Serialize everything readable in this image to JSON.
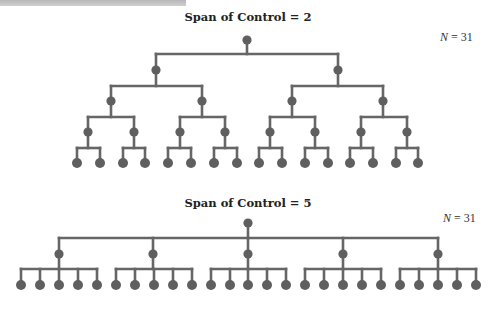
{
  "colors": {
    "line": "#666666",
    "node": "#5f5f5f",
    "text": "#222222",
    "topbar": "#c4c4c4"
  },
  "diagrams": [
    {
      "title": "Span of Control = 2",
      "title_pos": [
        248,
        21
      ],
      "n_label": {
        "var": "N",
        "eq": " = 31",
        "pos": [
          440,
          41
        ]
      },
      "span": 2,
      "total_nodes": 31,
      "levels": [
        {
          "y": 40,
          "bar_y": null,
          "x": [
            247
          ]
        },
        {
          "y": 70,
          "bar_y": 54,
          "x": [
            156,
            338
          ]
        },
        {
          "y": 101,
          "bar_y": 86,
          "x": [
            111,
            202,
            292,
            383
          ]
        },
        {
          "y": 132,
          "bar_y": 117,
          "x": [
            88,
            134,
            180,
            225,
            270,
            315,
            361,
            407
          ]
        },
        {
          "y": 163,
          "bar_y": 148,
          "x": [
            77,
            100,
            123,
            145,
            168,
            191,
            214,
            237,
            259,
            282,
            305,
            328,
            350,
            373,
            396,
            418
          ]
        }
      ]
    },
    {
      "title": "Span of Control = 5",
      "title_pos": [
        248,
        207
      ],
      "n_label": {
        "var": "N",
        "eq": " = 31",
        "pos": [
          443,
          222
        ]
      },
      "span": 5,
      "total_nodes": 31,
      "levels": [
        {
          "y": 223,
          "bar_y": null,
          "x": [
            248
          ]
        },
        {
          "y": 254,
          "bar_y": 238,
          "x": [
            59,
            153,
            248,
            343,
            438
          ]
        },
        {
          "y": 285,
          "bar_y": 269,
          "x": [
            21,
            40,
            59,
            78,
            97,
            116,
            135,
            154,
            173,
            192,
            211,
            230,
            248,
            267,
            286,
            305,
            324,
            343,
            362,
            381,
            400,
            419,
            438,
            457,
            476
          ]
        }
      ]
    }
  ]
}
